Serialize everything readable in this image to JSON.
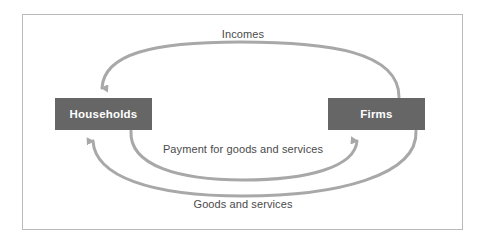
{
  "diagram": {
    "type": "circular-flow",
    "nodes": [
      {
        "id": "households",
        "label": "Households"
      },
      {
        "id": "firms",
        "label": "Firms"
      }
    ],
    "flows": [
      {
        "id": "incomes",
        "label": "Incomes",
        "from": "Firms",
        "to": "Households",
        "position": "top-outer"
      },
      {
        "id": "payment",
        "label": "Payment for goods and services",
        "from": "Households",
        "to": "Firms",
        "position": "bottom-inner"
      },
      {
        "id": "goods",
        "label": "Goods and services",
        "from": "Firms",
        "to": "Households",
        "position": "bottom-outer"
      }
    ],
    "colors": {
      "node_fill": "#666666",
      "node_text": "#ffffff",
      "arrow": "#a8a8a8",
      "label_text": "#4a4a4a",
      "frame_border": "#b9b9b9",
      "background": "#ffffff"
    }
  }
}
